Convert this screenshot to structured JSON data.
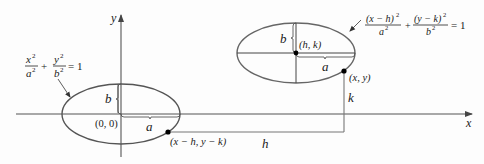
{
  "diagram": {
    "axes": {
      "x_label": "x",
      "y_label": "y"
    },
    "left_ellipse": {
      "equation": {
        "term1_num": "x",
        "term1_num_exp": "2",
        "term1_den": "a",
        "term1_den_exp": "2",
        "plus": "+",
        "term2_num": "y",
        "term2_num_exp": "2",
        "term2_den": "b",
        "term2_den_exp": "2",
        "equals": "= 1"
      },
      "center_label": "(0, 0)",
      "semi_major_label": "a",
      "semi_minor_label": "b",
      "point_label": "(x − h, y − k)"
    },
    "right_ellipse": {
      "equation": {
        "term1_num": "(x − h)",
        "term1_num_exp": "2",
        "term1_den": "a",
        "term1_den_exp": "2",
        "plus": "+",
        "term2_num": "(y − k)",
        "term2_num_exp": "2",
        "term2_den": "b",
        "term2_den_exp": "2",
        "equals": "= 1"
      },
      "center_label": "(h, k)",
      "semi_major_label": "a",
      "semi_minor_label": "b",
      "point_label": "(x, y)"
    },
    "shift_labels": {
      "horizontal": "h",
      "vertical": "k"
    },
    "colors": {
      "ellipse": "#555555",
      "axis": "#555555",
      "text": "#1a1a1a",
      "point": "#000000"
    }
  }
}
